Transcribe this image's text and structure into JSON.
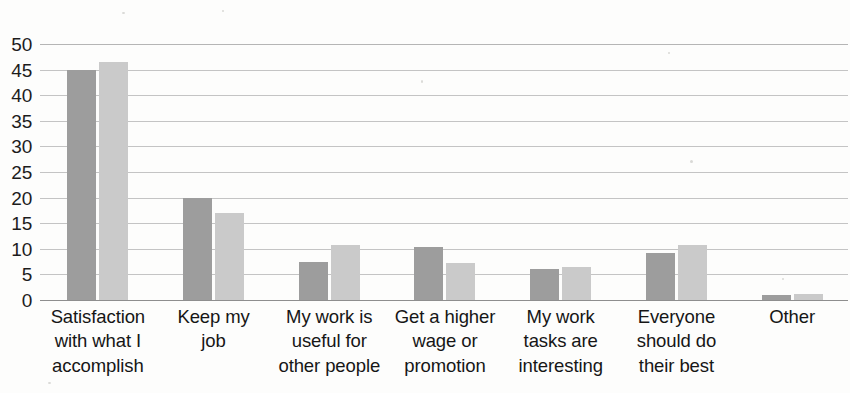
{
  "chart_data": {
    "type": "bar",
    "title": "",
    "subtitle": "",
    "xlabel": "",
    "ylabel": "",
    "ylim": [
      0,
      50
    ],
    "y_ticks": [
      0,
      5,
      10,
      15,
      20,
      25,
      30,
      35,
      40,
      45,
      50
    ],
    "grid": true,
    "legend": "none",
    "orientation": "vertical",
    "grouping": "grouped",
    "categories": [
      "Satisfaction with what I accomplish",
      "Keep my job",
      "My work is useful for other people",
      "Get a higher wage or promotion",
      "My work tasks are interesting",
      "Everyone should do their best",
      "Other"
    ],
    "category_lines": [
      [
        "Satisfaction",
        "with what I",
        "accomplish"
      ],
      [
        "Keep my",
        "job"
      ],
      [
        "My work is",
        "useful for",
        "other people"
      ],
      [
        "Get a higher",
        "wage or",
        "promotion"
      ],
      [
        "My work",
        "tasks are",
        "interesting"
      ],
      [
        "Everyone",
        "should do",
        "their best"
      ],
      [
        "Other"
      ]
    ],
    "series": [
      {
        "name": "Series 1",
        "color": "#9d9d9d",
        "values": [
          45.0,
          20.0,
          7.5,
          10.3,
          6.0,
          9.2,
          1.0
        ]
      },
      {
        "name": "Series 2",
        "color": "#cacaca",
        "values": [
          46.5,
          17.0,
          10.8,
          7.3,
          6.5,
          10.8,
          1.2
        ]
      }
    ]
  },
  "colors": {
    "series_dark": "#9d9d9d",
    "series_light": "#cacaca",
    "gridline": "#c4c4c4",
    "axis": "#8e8e8e",
    "text": "#161616",
    "background": "#fdfdfc"
  }
}
